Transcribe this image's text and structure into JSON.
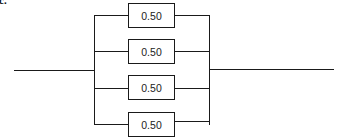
{
  "diagram": {
    "type": "parallel-system",
    "label": "c.",
    "components": [
      {
        "id": 1,
        "value": "0.50"
      },
      {
        "id": 2,
        "value": "0.50"
      },
      {
        "id": 3,
        "value": "0.50"
      },
      {
        "id": 4,
        "value": "0.50"
      }
    ],
    "line_color": "#1a1a1a"
  }
}
